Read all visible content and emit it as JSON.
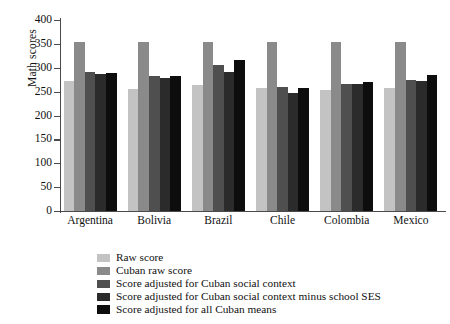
{
  "chart_data": {
    "type": "bar",
    "title": "",
    "xlabel": "",
    "ylabel": "Math scores",
    "ylim": [
      0,
      400
    ],
    "yticks": [
      0,
      50,
      100,
      150,
      200,
      250,
      300,
      350,
      400
    ],
    "grid": false,
    "legend_position": "bottom",
    "categories": [
      "Argentina",
      "Bolivia",
      "Brazil",
      "Chile",
      "Colombia",
      "Mexico"
    ],
    "series": [
      {
        "name": "Raw score",
        "color": "#c3c3c3",
        "values": [
          272,
          255,
          264,
          257,
          253,
          257
        ]
      },
      {
        "name": "Cuban raw score",
        "color": "#8a8a8a",
        "values": [
          353,
          353,
          353,
          353,
          353,
          353
        ]
      },
      {
        "name": "Score adjusted for Cuban social context",
        "color": "#4f4f4f",
        "values": [
          291,
          283,
          306,
          260,
          266,
          275
        ]
      },
      {
        "name": "Score adjusted for Cuban social context minus school SES",
        "color": "#2b2b2b",
        "values": [
          287,
          278,
          291,
          248,
          267,
          272
        ]
      },
      {
        "name": "Score adjusted for all Cuban means",
        "color": "#0d0d0d",
        "values": [
          290,
          282,
          317,
          258,
          271,
          284
        ]
      }
    ]
  },
  "axis": {
    "y_title": "Math scores"
  }
}
